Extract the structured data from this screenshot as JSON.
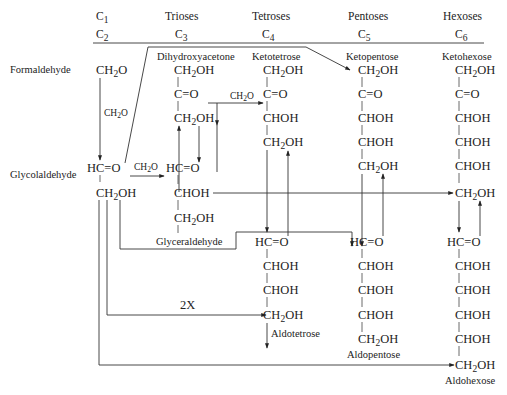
{
  "header": {
    "col_c1_c2": {
      "top": "C",
      "top_sub": "1",
      "bottom": "C",
      "bottom_sub": "2"
    },
    "trioses": {
      "title": "Trioses",
      "carbon": "C",
      "sub": "3"
    },
    "tetroses": {
      "title": "Tetroses",
      "carbon": "C",
      "sub": "4"
    },
    "pentoses": {
      "title": "Pentoses",
      "carbon": "C",
      "sub": "5"
    },
    "hexoses": {
      "title": "Hexoses",
      "carbon": "C",
      "sub": "6"
    }
  },
  "side_labels": {
    "formaldehyde": "Formaldehyde",
    "glycolaldehyde": "Glycolaldehyde"
  },
  "compound_labels": {
    "dihydroxyacetone": "Dihydroxyacetone",
    "glyceraldehyde": "Glyceraldehyde",
    "ketotetrose": "Ketotetrose",
    "aldotetrose": "Aldotetrose",
    "ketopentose": "Ketopentose",
    "aldopentose": "Aldopentose",
    "ketohexose": "Ketohexose",
    "aldohexose": "Aldohexose"
  },
  "arrow_labels": {
    "ch2o": "CH",
    "ch2o_sub": "2",
    "ch2o_end": "O",
    "twox": "2X"
  },
  "groups": {
    "CH2O": [
      "CH",
      "2",
      "O"
    ],
    "CH2OH": [
      "CH",
      "2",
      "OH"
    ],
    "CO": "C=O",
    "HCO": "HC=O",
    "CHOH": "CHOH"
  }
}
